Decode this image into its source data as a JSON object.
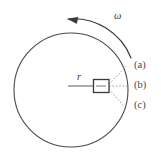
{
  "figure": {
    "type": "physics-diagram",
    "colors": {
      "stroke": "#4a4a4a",
      "dotted_stroke": "#8a8a8a",
      "background": "#ffffff",
      "box_fill": "#ffffff"
    },
    "circle": {
      "center_x": 71,
      "center_y": 90,
      "radius": 57
    },
    "labels": {
      "omega": "ω",
      "radius": "r",
      "option_a": "(a)",
      "option_b": "(b)",
      "option_c": "(c)"
    },
    "rotation": {
      "direction": "counterclockwise",
      "arrow_label": "ω"
    },
    "dotted_lines": [
      {
        "id": "a",
        "label": "(a)",
        "end_x": 126,
        "end_y": 66
      },
      {
        "id": "b",
        "label": "(b)",
        "end_x": 129,
        "end_y": 86
      },
      {
        "id": "c",
        "label": "(c)",
        "end_x": 124,
        "end_y": 106
      }
    ],
    "block": {
      "x": 93,
      "y": 79,
      "width": 16,
      "height": 14
    },
    "radius_line": {
      "from_x": 68,
      "from_y": 86,
      "to_x": 93,
      "to_y": 86
    }
  }
}
